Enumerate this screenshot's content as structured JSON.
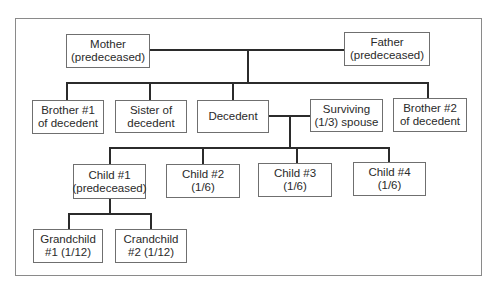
{
  "diagram": {
    "type": "family-tree-intestate-succession",
    "nodes": {
      "mother": {
        "line1": "Mother",
        "line2": "(predeceased)"
      },
      "father": {
        "line1": "Father",
        "line2": "(predeceased)"
      },
      "brother1": {
        "line1": "Brother #1",
        "line2": "of decedent"
      },
      "sister": {
        "line1": "Sister of",
        "line2": "decedent"
      },
      "decedent": {
        "line1": "Decedent",
        "line2": ""
      },
      "spouse": {
        "line1": "Surviving",
        "line2": "(1/3) spouse"
      },
      "brother2": {
        "line1": "Brother #2",
        "line2": "of decedent"
      },
      "child1": {
        "line1": "Child #1",
        "line2": "(predeceased)"
      },
      "child2": {
        "line1": "Child #2",
        "line2": "(1/6)"
      },
      "child3": {
        "line1": "Child #3",
        "line2": "(1/6)"
      },
      "child4": {
        "line1": "Child #4",
        "line2": "(1/6)"
      },
      "grandchild1": {
        "line1": "Grandchild",
        "line2": "#1 (1/12)"
      },
      "grandchild2": {
        "line1": "Crandchild",
        "line2": "#2 (1/12)"
      }
    },
    "edges": [
      [
        "mother",
        "father",
        "marriage"
      ],
      [
        "mother+father",
        "brother1"
      ],
      [
        "mother+father",
        "sister"
      ],
      [
        "mother+father",
        "decedent"
      ],
      [
        "mother+father",
        "brother2"
      ],
      [
        "decedent",
        "spouse",
        "marriage"
      ],
      [
        "decedent+spouse",
        "child1"
      ],
      [
        "decedent+spouse",
        "child2"
      ],
      [
        "decedent+spouse",
        "child3"
      ],
      [
        "decedent+spouse",
        "child4"
      ],
      [
        "child1",
        "grandchild1"
      ],
      [
        "child1",
        "grandchild2"
      ]
    ],
    "colors": {
      "line": "#2b2b2b",
      "box_border": "#6f6f6f",
      "frame": "#8a8a8a"
    }
  }
}
